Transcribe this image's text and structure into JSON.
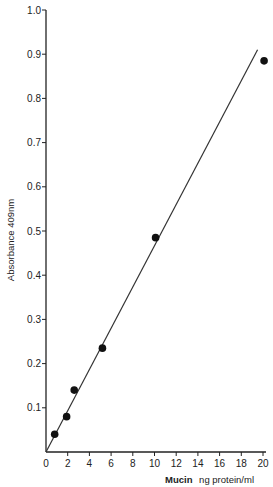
{
  "chart_data": {
    "type": "scatter",
    "title": "",
    "xlabel": "Mucin ng protein/ml",
    "xlabel_bold_part": "Mucin",
    "xlabel_rest": "ng protein/ml",
    "ylabel": "Absorbance 409nm",
    "xlim": [
      0,
      20
    ],
    "ylim": [
      0,
      1.0
    ],
    "x_ticks": [
      0,
      2,
      4,
      6,
      8,
      10,
      12,
      14,
      16,
      18,
      20
    ],
    "x_tick_labels": [
      "0",
      "2",
      "4",
      "6",
      "8",
      "10",
      "12",
      "14",
      "16",
      "18",
      "20"
    ],
    "y_ticks": [
      0.1,
      0.2,
      0.3,
      0.4,
      0.5,
      0.6,
      0.7,
      0.8,
      0.9,
      1.0
    ],
    "y_tick_labels": [
      "0.1",
      "0.2",
      "0.3",
      "0.4",
      "0.5",
      "0.6",
      "0.7",
      "0.8",
      "0.9",
      "1.0"
    ],
    "grid": false,
    "legend": null,
    "series": [
      {
        "name": "Mucin standard",
        "type": "scatter",
        "x": [
          0.8,
          1.9,
          2.6,
          5.2,
          10.1,
          20.1
        ],
        "y": [
          0.04,
          0.08,
          0.14,
          0.235,
          0.485,
          0.885
        ]
      },
      {
        "name": "Linear fit",
        "type": "line",
        "x": [
          0,
          19.5
        ],
        "y": [
          0.0,
          0.91
        ]
      }
    ]
  }
}
